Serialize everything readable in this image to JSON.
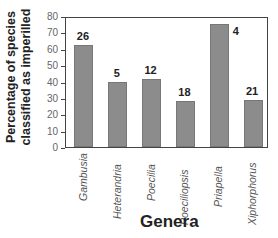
{
  "chart_data": {
    "type": "bar",
    "title": "",
    "xlabel": "Genera",
    "ylabel": "Percentage of species classified as imperilled",
    "ylim": [
      0,
      80
    ],
    "yticks": [
      0,
      10,
      20,
      30,
      40,
      50,
      60,
      70,
      80
    ],
    "grid": false,
    "legend": null,
    "categories": [
      "Gambusia",
      "Heterandria",
      "Poecilia",
      "Poeciliopsis",
      "Priapella",
      "Xiphorphorus"
    ],
    "values": [
      62,
      40,
      41.5,
      28,
      75,
      29
    ],
    "annotations": [
      "26",
      "5",
      "12",
      "18",
      "4",
      "21"
    ],
    "bar_color": "#8c8c8c"
  },
  "labels": {
    "ytitle_line1": "Percentage of species",
    "ytitle_line2": "classified as imperilled",
    "xtitle": "Genera"
  }
}
